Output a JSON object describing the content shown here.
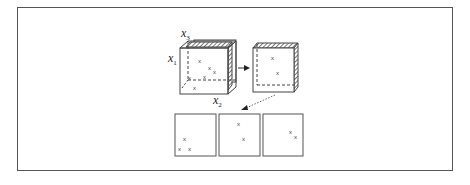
{
  "diagram": {
    "axes": {
      "x1": {
        "base": "x",
        "sub": "1"
      },
      "x2": {
        "base": "x",
        "sub": "2"
      },
      "x3": {
        "base": "x",
        "sub": "3"
      }
    },
    "point_marker": "x",
    "cube_points": [
      {
        "x": 200,
        "y": 62
      },
      {
        "x": 209,
        "y": 69
      },
      {
        "x": 214,
        "y": 73
      },
      {
        "x": 190,
        "y": 78
      },
      {
        "x": 204,
        "y": 77
      },
      {
        "x": 195,
        "y": 88
      }
    ],
    "slice_points": [
      {
        "x": 272,
        "y": 58
      },
      {
        "x": 277,
        "y": 73
      }
    ],
    "panels": [
      {
        "points": [
          {
            "x": 11,
            "y": 23
          },
          {
            "x": 6,
            "y": 33
          },
          {
            "x": 16,
            "y": 33
          }
        ]
      },
      {
        "points": [
          {
            "x": 20,
            "y": 9
          },
          {
            "x": 25,
            "y": 23
          }
        ]
      },
      {
        "points": [
          {
            "x": 29,
            "y": 17
          },
          {
            "x": 34,
            "y": 22
          }
        ]
      }
    ],
    "colors": {
      "stroke": "#444444",
      "hatch": "#555555",
      "frame": "#555555"
    }
  }
}
